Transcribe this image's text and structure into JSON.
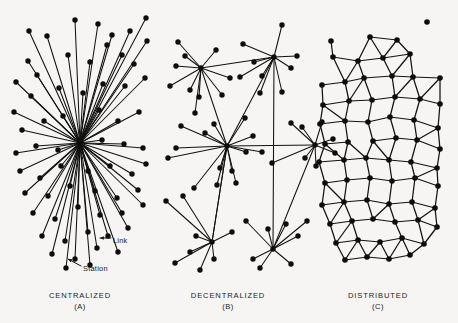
{
  "figure": {
    "background_color": "#f6f5f3",
    "ink_color": "#121212",
    "width": 458,
    "height": 323
  },
  "panels": [
    {
      "id": "A",
      "name": "centralized",
      "caption": "CENTRALIZED",
      "sub_caption": "(A)",
      "caption_x": 80,
      "caption_y": 291,
      "node_radius": 2.7,
      "hubs": [
        [
          80,
          143
        ]
      ],
      "nodes": [
        [
          80,
          143
        ],
        [
          29,
          31
        ],
        [
          75,
          20
        ],
        [
          107,
          45
        ],
        [
          28,
          61
        ],
        [
          47,
          36
        ],
        [
          130,
          31
        ],
        [
          98,
          24
        ],
        [
          146,
          18
        ],
        [
          16,
          82
        ],
        [
          37,
          75
        ],
        [
          68,
          55
        ],
        [
          90,
          62
        ],
        [
          122,
          55
        ],
        [
          112,
          35
        ],
        [
          134,
          64
        ],
        [
          147,
          41
        ],
        [
          14,
          112
        ],
        [
          31,
          96
        ],
        [
          59,
          88
        ],
        [
          83,
          93
        ],
        [
          103,
          84
        ],
        [
          125,
          86
        ],
        [
          145,
          78
        ],
        [
          22,
          130
        ],
        [
          44,
          121
        ],
        [
          63,
          116
        ],
        [
          99,
          110
        ],
        [
          118,
          121
        ],
        [
          139,
          112
        ],
        [
          16,
          153
        ],
        [
          36,
          146
        ],
        [
          58,
          150
        ],
        [
          102,
          140
        ],
        [
          124,
          144
        ],
        [
          143,
          148
        ],
        [
          20,
          171
        ],
        [
          40,
          178
        ],
        [
          61,
          166
        ],
        [
          88,
          171
        ],
        [
          110,
          166
        ],
        [
          132,
          174
        ],
        [
          146,
          164
        ],
        [
          25,
          193
        ],
        [
          48,
          196
        ],
        [
          70,
          186
        ],
        [
          95,
          191
        ],
        [
          117,
          198
        ],
        [
          138,
          190
        ],
        [
          33,
          213
        ],
        [
          55,
          219
        ],
        [
          78,
          207
        ],
        [
          100,
          215
        ],
        [
          122,
          213
        ],
        [
          143,
          205
        ],
        [
          42,
          236
        ],
        [
          65,
          241
        ],
        [
          88,
          232
        ],
        [
          108,
          236
        ],
        [
          128,
          228
        ],
        [
          52,
          254
        ],
        [
          75,
          259
        ],
        [
          97,
          248
        ],
        [
          118,
          252
        ],
        [
          66,
          268
        ],
        [
          90,
          265
        ]
      ],
      "annotations": [
        {
          "label": "Link",
          "label_x": 113,
          "label_y": 240,
          "leader": [
            [
              111,
              238
            ],
            [
              100,
              238
            ]
          ],
          "arrow_at": [
            99,
            238
          ]
        },
        {
          "label": "Station",
          "label_x": 83,
          "label_y": 268,
          "leader": [
            [
              81,
              266
            ],
            [
              68,
              259
            ]
          ],
          "arrow_at": [
            67,
            258
          ]
        }
      ]
    },
    {
      "id": "B",
      "name": "decentralized",
      "caption": "DECENTRALIZED",
      "sub_caption": "(B)",
      "caption_x": 228,
      "caption_y": 291,
      "node_radius": 2.7,
      "hubs": [
        [
          201,
          68
        ],
        [
          274,
          57
        ],
        [
          227,
          146
        ],
        [
          273,
          249
        ],
        [
          212,
          242
        ],
        [
          315,
          145
        ]
      ],
      "nodes": [
        [
          201,
          68
        ],
        [
          274,
          57
        ],
        [
          227,
          146
        ],
        [
          273,
          249
        ],
        [
          212,
          242
        ],
        [
          315,
          145
        ],
        [
          178,
          42
        ],
        [
          216,
          50
        ],
        [
          243,
          44
        ],
        [
          282,
          25
        ],
        [
          185,
          56
        ],
        [
          176,
          66
        ],
        [
          170,
          86
        ],
        [
          190,
          90
        ],
        [
          199,
          97
        ],
        [
          222,
          95
        ],
        [
          230,
          78
        ],
        [
          240,
          77
        ],
        [
          254,
          62
        ],
        [
          262,
          76
        ],
        [
          291,
          68
        ],
        [
          297,
          56
        ],
        [
          260,
          93
        ],
        [
          282,
          92
        ],
        [
          195,
          113
        ],
        [
          181,
          126
        ],
        [
          214,
          124
        ],
        [
          205,
          133
        ],
        [
          245,
          118
        ],
        [
          253,
          136
        ],
        [
          291,
          123
        ],
        [
          302,
          127
        ],
        [
          322,
          122
        ],
        [
          333,
          139
        ],
        [
          335,
          153
        ],
        [
          316,
          166
        ],
        [
          305,
          158
        ],
        [
          262,
          152
        ],
        [
          272,
          163
        ],
        [
          168,
          158
        ],
        [
          176,
          148
        ],
        [
          246,
          152
        ],
        [
          220,
          168
        ],
        [
          232,
          171
        ],
        [
          194,
          188
        ],
        [
          217,
          185
        ],
        [
          236,
          183
        ],
        [
          183,
          196
        ],
        [
          166,
          201
        ],
        [
          246,
          221
        ],
        [
          232,
          232
        ],
        [
          196,
          236
        ],
        [
          190,
          252
        ],
        [
          214,
          259
        ],
        [
          175,
          263
        ],
        [
          200,
          270
        ],
        [
          260,
          268
        ],
        [
          291,
          264
        ],
        [
          298,
          236
        ],
        [
          307,
          221
        ],
        [
          268,
          229
        ],
        [
          286,
          224
        ],
        [
          253,
          259
        ]
      ],
      "annotations": []
    },
    {
      "id": "C",
      "name": "distributed",
      "caption": "DISTRIBUTED",
      "sub_caption": "(C)",
      "caption_x": 378,
      "caption_y": 291,
      "node_radius": 2.8,
      "nodes": [
        [
          331,
          41
        ],
        [
          370,
          37
        ],
        [
          397,
          40
        ],
        [
          427,
          22
        ],
        [
          333,
          57
        ],
        [
          358,
          61
        ],
        [
          383,
          58
        ],
        [
          410,
          54
        ],
        [
          322,
          85
        ],
        [
          345,
          82
        ],
        [
          364,
          78
        ],
        [
          392,
          76
        ],
        [
          413,
          77
        ],
        [
          440,
          78
        ],
        [
          323,
          105
        ],
        [
          349,
          101
        ],
        [
          372,
          100
        ],
        [
          395,
          97
        ],
        [
          420,
          99
        ],
        [
          440,
          104
        ],
        [
          320,
          124
        ],
        [
          345,
          121
        ],
        [
          368,
          122
        ],
        [
          390,
          117
        ],
        [
          414,
          120
        ],
        [
          438,
          128
        ],
        [
          325,
          144
        ],
        [
          348,
          142
        ],
        [
          373,
          141
        ],
        [
          396,
          138
        ],
        [
          417,
          140
        ],
        [
          440,
          149
        ],
        [
          319,
          162
        ],
        [
          344,
          160
        ],
        [
          366,
          158
        ],
        [
          389,
          160
        ],
        [
          411,
          162
        ],
        [
          437,
          168
        ],
        [
          325,
          183
        ],
        [
          347,
          180
        ],
        [
          370,
          178
        ],
        [
          392,
          181
        ],
        [
          415,
          178
        ],
        [
          438,
          186
        ],
        [
          322,
          205
        ],
        [
          344,
          202
        ],
        [
          367,
          200
        ],
        [
          389,
          204
        ],
        [
          412,
          202
        ],
        [
          435,
          208
        ],
        [
          330,
          224
        ],
        [
          352,
          221
        ],
        [
          373,
          219
        ],
        [
          395,
          222
        ],
        [
          418,
          220
        ],
        [
          437,
          227
        ],
        [
          336,
          243
        ],
        [
          358,
          240
        ],
        [
          380,
          242
        ],
        [
          402,
          238
        ],
        [
          424,
          244
        ],
        [
          345,
          260
        ],
        [
          367,
          257
        ],
        [
          389,
          259
        ],
        [
          410,
          255
        ]
      ],
      "annotations": []
    }
  ]
}
